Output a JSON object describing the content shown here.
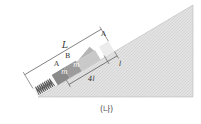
{
  "diagram": {
    "caption": "(나)",
    "labels": {
      "length_total": "L",
      "block_a_lower": "A",
      "block_b": "B",
      "block_a_upper": "A",
      "mass_lower": "m",
      "mass_upper": "m",
      "distance_4l": "4l",
      "distance_l": "l"
    },
    "colors": {
      "incline": "#dcdcdc",
      "block_dark": "#8a8a8a",
      "block_mid": "#a8a8a8",
      "spring": "#555555",
      "line": "#444444"
    }
  }
}
